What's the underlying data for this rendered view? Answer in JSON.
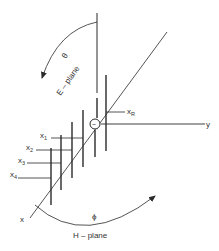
{
  "figure": {
    "type": "yagi-uda antenna array coordinate diagram",
    "colors": {
      "line": "#2a2a2a",
      "background": "#ffffff"
    },
    "axes": {
      "x_label": "x",
      "y_label": "y"
    },
    "angles": {
      "theta_symbol": "θ",
      "phi_symbol": "ϕ"
    },
    "planes": {
      "e_plane_label": "E – plane",
      "h_plane_label": "H – plane"
    },
    "elements": {
      "reflector": {
        "base": "x",
        "sub": "R"
      },
      "directors": [
        {
          "base": "x",
          "sub": "1"
        },
        {
          "base": "x",
          "sub": "2"
        },
        {
          "base": "x",
          "sub": "3"
        },
        {
          "base": "x",
          "sub": "4"
        }
      ],
      "source_symbol": "~"
    }
  }
}
